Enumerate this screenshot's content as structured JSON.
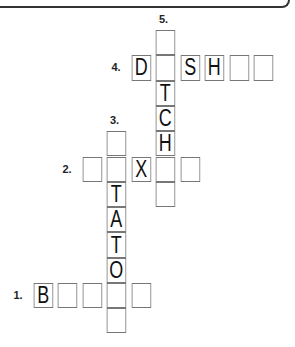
{
  "puzzle": {
    "clues": [
      {
        "number": "1.",
        "direction": "across",
        "row": 10,
        "col": 0,
        "length": 5
      },
      {
        "number": "2.",
        "direction": "across",
        "row": 5,
        "col": 2,
        "length": 5
      },
      {
        "number": "3.",
        "direction": "down",
        "row": 4,
        "col": 3,
        "length": 8
      },
      {
        "number": "4.",
        "direction": "across",
        "row": 1,
        "col": 4,
        "length": 6
      },
      {
        "number": "5.",
        "direction": "down",
        "row": 0,
        "col": 5,
        "length": 7
      }
    ],
    "cells": [
      {
        "row": 0,
        "col": 5,
        "letter": ""
      },
      {
        "row": 1,
        "col": 4,
        "letter": "D"
      },
      {
        "row": 1,
        "col": 5,
        "letter": ""
      },
      {
        "row": 1,
        "col": 6,
        "letter": "S"
      },
      {
        "row": 1,
        "col": 7,
        "letter": "H"
      },
      {
        "row": 1,
        "col": 8,
        "letter": ""
      },
      {
        "row": 1,
        "col": 9,
        "letter": ""
      },
      {
        "row": 2,
        "col": 5,
        "letter": "T"
      },
      {
        "row": 3,
        "col": 5,
        "letter": "C"
      },
      {
        "row": 4,
        "col": 5,
        "letter": "H"
      },
      {
        "row": 4,
        "col": 3,
        "letter": ""
      },
      {
        "row": 5,
        "col": 2,
        "letter": ""
      },
      {
        "row": 5,
        "col": 3,
        "letter": ""
      },
      {
        "row": 5,
        "col": 4,
        "letter": "X"
      },
      {
        "row": 5,
        "col": 5,
        "letter": ""
      },
      {
        "row": 5,
        "col": 6,
        "letter": ""
      },
      {
        "row": 6,
        "col": 5,
        "letter": ""
      },
      {
        "row": 6,
        "col": 3,
        "letter": "T"
      },
      {
        "row": 7,
        "col": 3,
        "letter": "A"
      },
      {
        "row": 8,
        "col": 3,
        "letter": "T"
      },
      {
        "row": 9,
        "col": 3,
        "letter": "O"
      },
      {
        "row": 10,
        "col": 0,
        "letter": "B"
      },
      {
        "row": 10,
        "col": 1,
        "letter": ""
      },
      {
        "row": 10,
        "col": 2,
        "letter": ""
      },
      {
        "row": 10,
        "col": 3,
        "letter": ""
      },
      {
        "row": 10,
        "col": 4,
        "letter": ""
      },
      {
        "row": 11,
        "col": 3,
        "letter": ""
      }
    ]
  }
}
